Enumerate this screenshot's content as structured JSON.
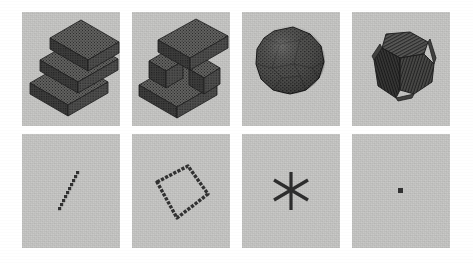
{
  "figure": {
    "type": "panel-grid",
    "rows": 2,
    "columns": 4,
    "background_color": "#ffffff",
    "panel_background_color": "#c9c9c7",
    "object_color": "#4a4a4a",
    "object_shade_top": "#6a6a68",
    "object_shade_left": "#3d3d3d",
    "object_shade_right": "#525250",
    "rendering_style": "voxelized-grayscale-halftone"
  },
  "panels": [
    {
      "id": "panel-staircase",
      "row": 1,
      "column": 1,
      "shape_name": "staircase",
      "description": "Three-step voxel staircase rendered in isometric projection",
      "step_count": 3,
      "has_hole": false
    },
    {
      "id": "panel-z-shape-with-hole",
      "row": 1,
      "column": 2,
      "shape_name": "z-shape-with-hole",
      "description": "Z shaped voxel solid with a square through-hole in the middle",
      "step_count": 3,
      "has_hole": true
    },
    {
      "id": "panel-sphere",
      "row": 1,
      "column": 3,
      "shape_name": "sphere",
      "description": "Voxelized sphere approximated as a faceted polyhedron",
      "facet_pattern": "hexagonal",
      "has_hole": false
    },
    {
      "id": "panel-rounded-cube",
      "row": 1,
      "column": 4,
      "shape_name": "rounded-cube",
      "description": "Voxelized cube with chamfered edges and striped face texture",
      "facet_pattern": "striped",
      "has_hole": false
    },
    {
      "id": "panel-line-segment",
      "row": 2,
      "column": 1,
      "shape_name": "line-segment",
      "description": "Single diagonal chain of voxels forming a short line",
      "dimension": 1
    },
    {
      "id": "panel-quadrilateral-outline",
      "row": 2,
      "column": 2,
      "shape_name": "quadrilateral-outline",
      "description": "Closed loop of voxels forming a rhombus outline",
      "dimension": 1
    },
    {
      "id": "panel-asterisk",
      "row": 2,
      "column": 3,
      "shape_name": "asterisk",
      "description": "Six armed asterisk formed by three crossed voxel segments",
      "arm_count": 6,
      "dimension": 1
    },
    {
      "id": "panel-point",
      "row": 2,
      "column": 4,
      "shape_name": "point",
      "description": "Single isolated voxel point",
      "dimension": 0
    }
  ]
}
